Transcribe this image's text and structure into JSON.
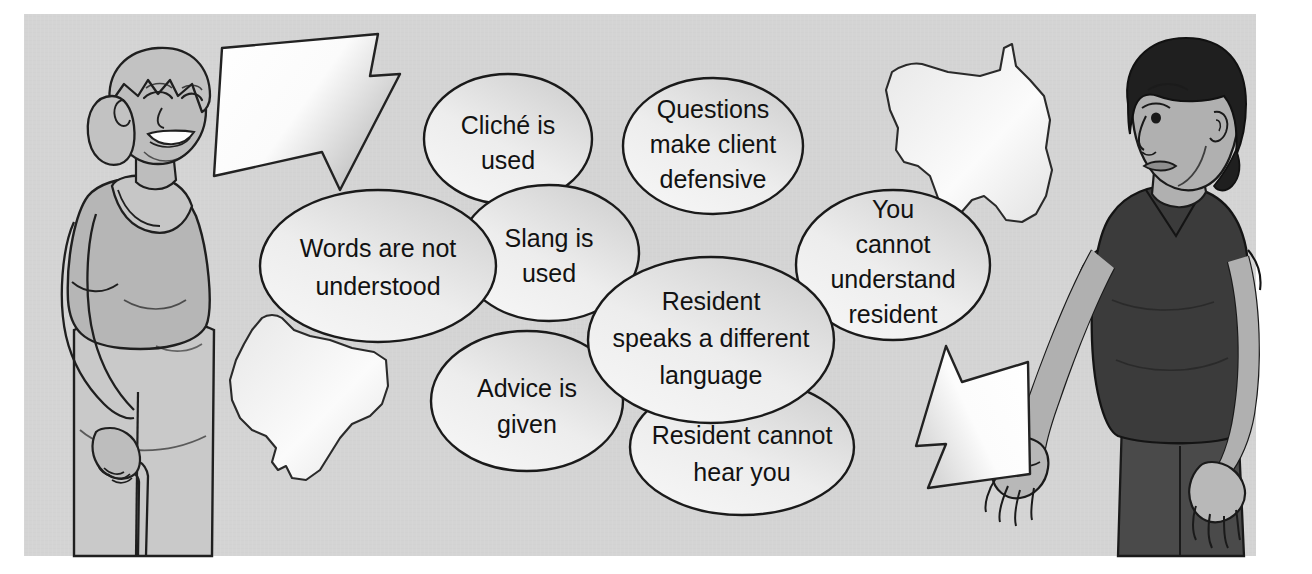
{
  "illustration": {
    "title": "Communication barriers illustration",
    "background_color": "#d2d2d2",
    "canvas_color": "#ffffff",
    "ellipse_stroke": "#1a1a1a",
    "ellipse_fill_light": "#f2f2f2",
    "ellipse_fill_dark": "#cfcfcf",
    "arrow_fill_light": "#ffffff",
    "arrow_fill_shadow": "#c4c4c4",
    "skin_tone": "#b4b4b4",
    "dark_clothing": "#3c3c3c",
    "light_clothing": "#c7c7c7",
    "hair_dark": "#1e1e1e",
    "hair_gray": "#bdbdbd"
  },
  "bubbles": [
    {
      "id": "cliche",
      "lines": [
        "Cliché is",
        "used"
      ]
    },
    {
      "id": "questions-defensive",
      "lines": [
        "Questions",
        "make client",
        "defensive"
      ]
    },
    {
      "id": "words-not-understood",
      "lines": [
        "Words are not",
        "understood"
      ]
    },
    {
      "id": "slang",
      "lines": [
        "Slang is",
        "used"
      ]
    },
    {
      "id": "you-cannot-understand",
      "lines": [
        "You",
        "cannot",
        "understand",
        "resident"
      ]
    },
    {
      "id": "different-language",
      "lines": [
        "Resident",
        "speaks a different",
        "language"
      ]
    },
    {
      "id": "advice",
      "lines": [
        "Advice is",
        "given"
      ]
    },
    {
      "id": "cannot-hear",
      "lines": [
        "Resident cannot",
        "hear you"
      ]
    }
  ],
  "figures": [
    {
      "id": "resident-elderly-woman",
      "label": "Elderly woman with cane, smiling"
    },
    {
      "id": "caregiver",
      "label": "Caregiver in dark shirt, gesturing"
    }
  ],
  "arrows": [
    {
      "id": "arrow-from-resident",
      "direction": "right"
    },
    {
      "id": "arrow-from-caregiver",
      "direction": "left"
    }
  ],
  "decor": [
    {
      "id": "map-shape-left"
    },
    {
      "id": "map-shape-right"
    }
  ]
}
